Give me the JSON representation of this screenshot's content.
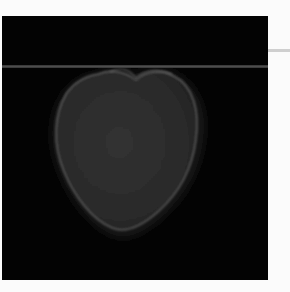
{
  "image": {
    "description": "Grayscale scan-style photograph of a heart-shaped object on a black background",
    "background_color": "#030303",
    "object_fill_color": "#2e2e2e",
    "object_edge_color": "#5c5c5c",
    "guide_line_color": "#4a4a4a",
    "page_color": "#fbfbfb"
  },
  "ghost_text": ""
}
